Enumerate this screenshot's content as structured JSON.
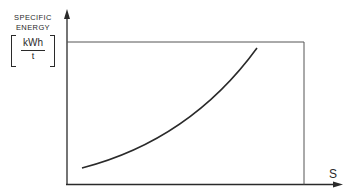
{
  "diagram": {
    "title": "",
    "y_axis": {
      "label_line1": "SPECIFIC",
      "label_line2": "ENERGY",
      "unit_numerator": "kWh",
      "unit_denominator": "t"
    },
    "x_axis": {
      "label": "S"
    },
    "curve": {
      "description": "convex increasing curve: specific energy rises with S",
      "start": {
        "x": 82,
        "y": 168
      },
      "end": {
        "x": 257,
        "y": 48
      }
    },
    "frame": {
      "top_line_y": 42,
      "right_edge_x": 304
    },
    "colors": {
      "ink": "#2a2a2a",
      "background": "#ffffff"
    }
  }
}
